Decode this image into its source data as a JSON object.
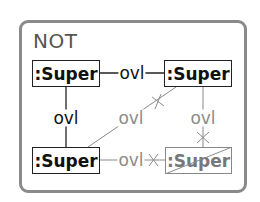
{
  "diagram": {
    "frame_label": "NOT",
    "colors": {
      "frame_border": "#8a8a8a",
      "solid": "#111111",
      "negated": "#8a8a8a"
    },
    "nodes": [
      {
        "id": "top-left",
        "label": ":Super",
        "style": "solid"
      },
      {
        "id": "top-right",
        "label": ":Super",
        "style": "solid"
      },
      {
        "id": "bottom-left",
        "label": ":Super",
        "style": "solid"
      },
      {
        "id": "bottom-right",
        "label": ":Super",
        "style": "negated",
        "crossed_out": true
      }
    ],
    "edges": [
      {
        "from": "top-left",
        "to": "top-right",
        "label": "ovl",
        "style": "solid"
      },
      {
        "from": "top-left",
        "to": "bottom-left",
        "label": "ovl",
        "style": "solid"
      },
      {
        "from": "bottom-left",
        "to": "top-right",
        "label": "ovl",
        "style": "negated",
        "end_marker": "cross"
      },
      {
        "from": "top-right",
        "to": "bottom-right",
        "label": "ovl",
        "style": "negated",
        "end_marker": "cross"
      },
      {
        "from": "bottom-left",
        "to": "bottom-right",
        "label": "ovl",
        "style": "negated",
        "end_marker": "cross"
      }
    ]
  }
}
